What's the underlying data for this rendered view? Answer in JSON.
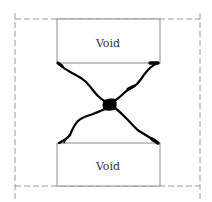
{
  "diagram": {
    "type": "void-crack-coalescence",
    "colors": {
      "background": "#ffffff",
      "outline": "#9a9a9a",
      "box_stroke": "#8a8a8a",
      "crack": "#000000",
      "text": "#333333"
    },
    "voids": [
      {
        "label": "Void",
        "position": "top"
      },
      {
        "label": "Void",
        "position": "bottom"
      }
    ],
    "boundary": {
      "style": "dashed"
    },
    "cracks": [
      {
        "from": "top-left corner of top void",
        "to": "center"
      },
      {
        "from": "top-right corner of top void",
        "to": "center"
      },
      {
        "from": "bottom-left corner of bottom void",
        "to": "center"
      },
      {
        "from": "bottom-right corner of bottom void",
        "to": "center"
      }
    ]
  }
}
